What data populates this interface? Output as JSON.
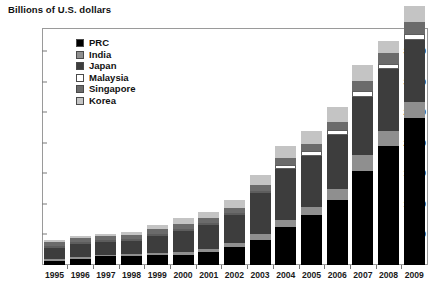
{
  "axis_title": "Billions of U.S. dollars",
  "legend": {
    "items": [
      {
        "label": "PRC",
        "color": "#000000",
        "icon": "legend-swatch-icon"
      },
      {
        "label": "India",
        "color": "#8f8f8f",
        "icon": "legend-swatch-icon"
      },
      {
        "label": "Japan",
        "color": "#3d3d3d",
        "icon": "legend-swatch-icon"
      },
      {
        "label": "Malaysia",
        "color": "#ffffff",
        "icon": "legend-swatch-icon"
      },
      {
        "label": "Singapore",
        "color": "#6b6b6b",
        "icon": "legend-swatch-icon"
      },
      {
        "label": "Korea",
        "color": "#c4c4c4",
        "icon": "legend-swatch-icon"
      }
    ]
  },
  "chart_data": {
    "type": "bar",
    "title": "",
    "subtitle": "",
    "xlabel": "",
    "ylabel": "Billions of U.S. dollars",
    "stacked": true,
    "grid": false,
    "legend_position": "inside-top-left",
    "ylim": [
      0,
      3800
    ],
    "yticks": [
      500,
      1000,
      1500,
      2000,
      2500,
      3000,
      3500
    ],
    "ytick_labels": [
      "500",
      "1,000",
      "1,500",
      "2,000",
      "2,500",
      "3,000",
      "3,500"
    ],
    "categories": [
      "1995",
      "1996",
      "1997",
      "1998",
      "1999",
      "2000",
      "2001",
      "2002",
      "2003",
      "2004",
      "2005",
      "2006",
      "2007",
      "2008",
      "2009"
    ],
    "series": [
      {
        "name": "PRC",
        "color": "#000000",
        "values": [
          75,
          107,
          143,
          150,
          158,
          169,
          216,
          292,
          409,
          615,
          822,
          1069,
          1531,
          1949,
          2399
        ]
      },
      {
        "name": "India",
        "color": "#8f8f8f",
        "values": [
          18,
          20,
          25,
          28,
          33,
          38,
          46,
          68,
          99,
          127,
          132,
          171,
          267,
          248,
          266
        ]
      },
      {
        "name": "Japan",
        "color": "#3d3d3d",
        "values": [
          184,
          217,
          220,
          216,
          288,
          355,
          396,
          462,
          664,
          834,
          835,
          880,
          953,
          1003,
          1022
        ]
      },
      {
        "name": "Malaysia",
        "color": "#ffffff",
        "values": [
          24,
          27,
          21,
          26,
          31,
          29,
          31,
          34,
          44,
          66,
          70,
          82,
          101,
          92,
          97
        ]
      },
      {
        "name": "Singapore",
        "color": "#6b6b6b",
        "values": [
          69,
          77,
          72,
          75,
          77,
          80,
          76,
          82,
          96,
          113,
          116,
          136,
          163,
          174,
          188
        ]
      },
      {
        "name": "Korea",
        "color": "#c4c4c4",
        "values": [
          33,
          34,
          20,
          52,
          74,
          96,
          103,
          121,
          155,
          199,
          210,
          239,
          262,
          201,
          270
        ]
      }
    ],
    "totals": [
      403,
      482,
      501,
      547,
      661,
      767,
      868,
      1059,
      1467,
      1954,
      2185,
      2577,
      3277,
      3667,
      4242
    ]
  }
}
